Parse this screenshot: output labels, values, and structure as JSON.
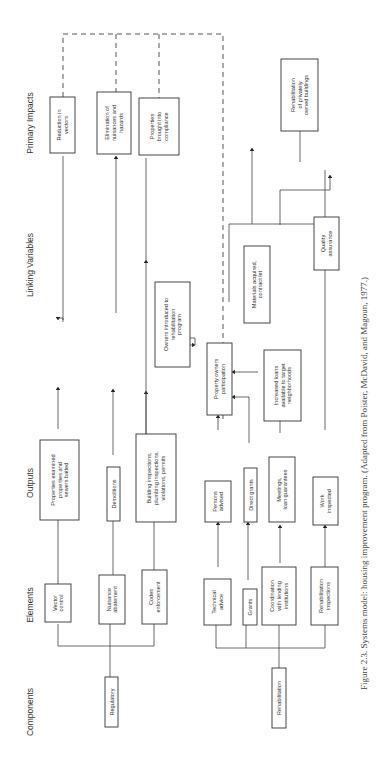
{
  "headers": {
    "components": "Components",
    "elements": "Elements",
    "outputs": "Outputs",
    "linking_variables": "Linking Variables",
    "primary_impacts": "Primary Impacts"
  },
  "components": {
    "regulatory": "Regulatory",
    "rehabilitation": "Rehabilitation"
  },
  "elements": {
    "vector_control": [
      "Vector",
      "control"
    ],
    "nuisance_abatement": [
      "Nuisance",
      "abatement"
    ],
    "codes_enforcement": [
      "Codes",
      "enforcement"
    ],
    "technical_advice": [
      "Technical",
      "advice"
    ],
    "grants": [
      "Grants"
    ],
    "coordination": [
      "Coordination",
      "with lending",
      "institutions"
    ],
    "rehab_inspections": [
      "Rehabilitation",
      "inspections"
    ]
  },
  "outputs": {
    "properties_examined": [
      "Properties examined",
      "properties and",
      "sewers baited"
    ],
    "demolitions": [
      "Demolitions"
    ],
    "building_inspections": [
      "Building inspections,",
      "plumbing inspections,",
      "violations, permits"
    ],
    "persons_advised": [
      "Persons",
      "advised"
    ],
    "direct_grants": [
      "Direct grants"
    ],
    "meetings": [
      "Meetings,",
      "loan guarantees"
    ],
    "work_inspected": [
      "Work",
      "inspected"
    ]
  },
  "linking": {
    "owners_introduced": [
      "Owners introduced to",
      "rehabilitation",
      "program"
    ],
    "property_owners": [
      "Property owners",
      "participation"
    ],
    "increased_loans": [
      "Increased loans",
      "available to target",
      "neighborhoods"
    ],
    "materials_acquired": [
      "Materials acquired,",
      "contract let"
    ],
    "quality_assurance": [
      "Quality",
      "assurance"
    ]
  },
  "impacts": {
    "reduction_vectors": [
      "Reduction in",
      "vectors"
    ],
    "elimination_nuisances": [
      "Elimination of",
      "nuisances and",
      "hazards"
    ],
    "properties_compliance": [
      "Properties",
      "brought into",
      "compliance"
    ],
    "rehab_buildings": [
      "Rehabilitation",
      "of privately",
      "owned buildings"
    ]
  },
  "caption": "Figure 2.3.   Systems model: housing improvement program. (Adapted from Poister, McDavid, and Magoun, 1977.)"
}
